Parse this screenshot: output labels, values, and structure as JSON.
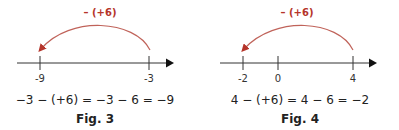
{
  "colors": {
    "arc": "#b5342a",
    "axis": "#333333"
  },
  "figures": [
    {
      "operation_label": "– (+6)",
      "ticks": [
        {
          "label": "-9",
          "x": 40
        },
        {
          "label": "-3",
          "x": 149
        }
      ],
      "equation": "−3 − (+6) = −3 − 6 = −9",
      "caption": "Fig. 3"
    },
    {
      "operation_label": "– (+6)",
      "ticks": [
        {
          "label": "-2",
          "x": 243
        },
        {
          "label": "0",
          "x": 278
        },
        {
          "label": "4",
          "x": 353
        }
      ],
      "equation": "4 − (+6) = 4 − 6 = −2",
      "caption": "Fig. 4"
    }
  ]
}
